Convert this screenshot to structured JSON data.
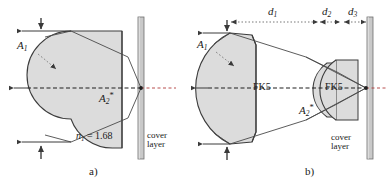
{
  "figure": {
    "type": "optical-ray-diagram",
    "background_color": "#ffffff",
    "glass_fill_color": "#dcdcdc",
    "glass_stroke_color": "#3c3c3c",
    "cover_layer_fill_color": "#c8c8c8",
    "ray_color": "#555555",
    "axis_color": "#cc3333"
  },
  "panels": [
    {
      "id": "a",
      "tag": "a)",
      "elements": {
        "aperture_label": {
          "base": "A",
          "sub": "1",
          "sup": ""
        },
        "exit_angle_label": {
          "base": "A",
          "sub": "2",
          "sup": "*"
        },
        "index_label": {
          "base": "n",
          "sub": "1",
          "rest": " = 1.68"
        },
        "cover_layer_label_line1": "cover",
        "cover_layer_label_line2": "layer"
      }
    },
    {
      "id": "b",
      "tag": "b)",
      "elements": {
        "aperture_label": {
          "base": "A",
          "sub": "1",
          "sup": ""
        },
        "exit_angle_label": {
          "base": "A",
          "sub": "2",
          "sup": "*"
        },
        "lens1_material": "FK5",
        "lens2_material": "FK5",
        "cover_layer_label_line1": "cover",
        "cover_layer_label_line2": "layer",
        "dimensions": [
          {
            "base": "d",
            "sub": "1"
          },
          {
            "base": "d",
            "sub": "2"
          },
          {
            "base": "d",
            "sub": "3"
          }
        ]
      }
    }
  ]
}
